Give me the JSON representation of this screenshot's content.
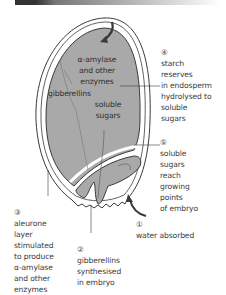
{
  "diagram": {
    "title_bar": "",
    "internal_labels": {
      "enzymes": "α-amylase\nand other\nenzymes",
      "gibberellins": "gibberellins",
      "soluble_sugars": "soluble\nsugars"
    },
    "steps": [
      {
        "number": "①",
        "text": "water absorbed"
      },
      {
        "number": "②",
        "text": "gibberellins\nsynthesised\nin embryo"
      },
      {
        "number": "③",
        "text": "aleurone\nlayer\nstimulated\nto produce\nα-amylase\nand other\nenzymes"
      },
      {
        "number": "④",
        "text": "starch\nreserves\nin endosperm\nhydrolysed to\nsoluble\nsugars"
      },
      {
        "number": "⑤",
        "text": "soluble\nsugars\nreach\ngrowing\npoints\nof embryo"
      }
    ],
    "colors": {
      "endosperm": "#a9a9a9",
      "seed_coat": "#ffffff",
      "outline": "#3a3a3a",
      "arrow": "#3a3a3a"
    }
  }
}
